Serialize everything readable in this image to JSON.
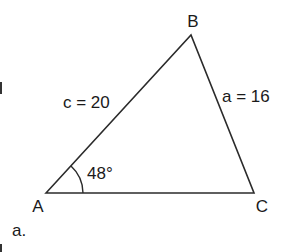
{
  "figure": {
    "label": "a.",
    "vertices": {
      "A": {
        "label": "A",
        "x": 46,
        "y": 193
      },
      "B": {
        "label": "B",
        "x": 191,
        "y": 35
      },
      "C": {
        "label": "C",
        "x": 254,
        "y": 193
      }
    },
    "sides": {
      "c": {
        "label": "c = 20"
      },
      "a": {
        "label": "a = 16"
      }
    },
    "angle_A": {
      "label": "48°"
    },
    "stroke_color": "#2b2b2b"
  }
}
